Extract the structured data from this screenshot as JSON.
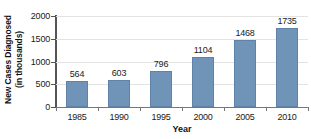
{
  "chart_data": {
    "type": "bar",
    "title": "",
    "xlabel": "Year",
    "ylabel": "New Cases Diagnosed (in thousands)",
    "ylabel_line1": "New Cases Diagnosed",
    "ylabel_line2": "(in thousands)",
    "categories": [
      "1985",
      "1990",
      "1995",
      "2000",
      "2005",
      "2010"
    ],
    "values": [
      564,
      603,
      796,
      1104,
      1468,
      1735
    ],
    "value_labels": [
      "564",
      "603",
      "796",
      "1104",
      "1468",
      "1735"
    ],
    "ylim": [
      0,
      2000
    ],
    "yticks": [
      0,
      500,
      1000,
      1500,
      2000
    ],
    "ytick_labels": [
      "0",
      "500",
      "1000",
      "1500",
      "2000"
    ],
    "grid": true,
    "grid_axis": "y",
    "legend": false,
    "bar_color": "#7093b8",
    "bar_edge_color": "#5f82a8",
    "axis_color": "#555555",
    "gridline_color": "#e3e3e3",
    "text_color": "#1a1a1a",
    "background_color": "#ffffff"
  }
}
